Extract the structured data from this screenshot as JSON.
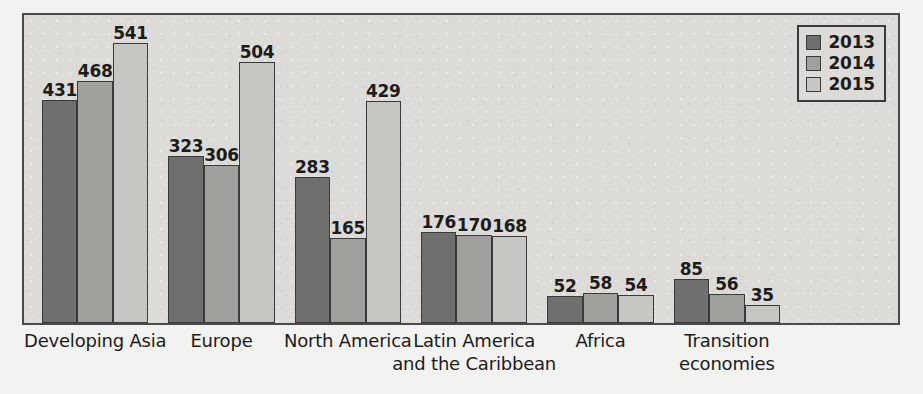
{
  "chart_data": {
    "type": "bar",
    "title": "",
    "subtitle": "",
    "xlabel": "",
    "ylabel": "",
    "grid": false,
    "legend_position": "top-right",
    "ylim": [
      0,
      541
    ],
    "categories": [
      "Developing Asia",
      "Europe",
      "North America",
      "Latin America\nand the Caribbean",
      "Africa",
      "Transition\neconomies"
    ],
    "category_lines": [
      [
        "Developing Asia"
      ],
      [
        "Europe"
      ],
      [
        "North America"
      ],
      [
        "Latin America",
        "and the Caribbean"
      ],
      [
        "Africa"
      ],
      [
        "Transition",
        "economies"
      ]
    ],
    "series": [
      {
        "name": "2013",
        "color": "#6f6f6d",
        "values": [
          431,
          323,
          283,
          176,
          52,
          85
        ]
      },
      {
        "name": "2014",
        "color": "#a0a09d",
        "values": [
          468,
          306,
          165,
          170,
          58,
          56
        ]
      },
      {
        "name": "2015",
        "color": "#c6c6c2",
        "values": [
          541,
          504,
          429,
          168,
          54,
          35
        ]
      }
    ],
    "data_labels": true
  },
  "legend": {
    "items": [
      {
        "label": "2013",
        "swatch": "s2013"
      },
      {
        "label": "2014",
        "swatch": "s2014"
      },
      {
        "label": "2015",
        "swatch": "s2015"
      }
    ]
  },
  "colors": {
    "series_2013": "#6f6f6d",
    "series_2014": "#a0a09d",
    "series_2015": "#c6c6c2",
    "plot_background": "#dcdbd7",
    "frame": "#4a4a4a",
    "text": "#1b1b1b"
  }
}
